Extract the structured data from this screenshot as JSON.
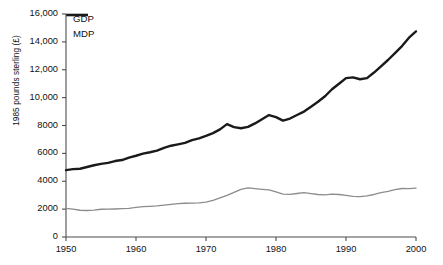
{
  "chart_data": {
    "type": "line",
    "title": "",
    "xlabel": "",
    "ylabel": "1985 pounds sterling (£)",
    "xlim": [
      1950,
      2000
    ],
    "ylim": [
      0,
      16000
    ],
    "grid": false,
    "legend_position": "top-left",
    "xticks": [
      "1950",
      "1960",
      "1970",
      "1980",
      "1990",
      "2000"
    ],
    "xtick_values": [
      1950,
      1960,
      1970,
      1980,
      1990,
      2000
    ],
    "yticks": [
      "0",
      "2000",
      "4000",
      "6000",
      "8000",
      "10,000",
      "12,000",
      "14,000",
      "16,000"
    ],
    "ytick_values": [
      0,
      2000,
      4000,
      6000,
      8000,
      10000,
      12000,
      14000,
      16000
    ],
    "x": [
      1950,
      1951,
      1952,
      1953,
      1954,
      1955,
      1956,
      1957,
      1958,
      1959,
      1960,
      1961,
      1962,
      1963,
      1964,
      1965,
      1966,
      1967,
      1968,
      1969,
      1970,
      1971,
      1972,
      1973,
      1974,
      1975,
      1976,
      1977,
      1978,
      1979,
      1980,
      1981,
      1982,
      1983,
      1984,
      1985,
      1986,
      1987,
      1988,
      1989,
      1990,
      1991,
      1992,
      1993,
      1994,
      1995,
      1996,
      1997,
      1998,
      1999,
      2000
    ],
    "series": [
      {
        "name": "GDP",
        "color": "#8c8c8c",
        "line_width": 1.3,
        "values": [
          2050,
          2000,
          1920,
          1900,
          1930,
          1990,
          2000,
          2010,
          2030,
          2060,
          2120,
          2180,
          2200,
          2230,
          2280,
          2340,
          2400,
          2420,
          2430,
          2450,
          2500,
          2620,
          2800,
          2980,
          3200,
          3420,
          3520,
          3470,
          3420,
          3380,
          3230,
          3080,
          3060,
          3120,
          3180,
          3110,
          3050,
          3020,
          3080,
          3050,
          2980,
          2910,
          2900,
          2950,
          3050,
          3180,
          3280,
          3400,
          3480,
          3470,
          3500
        ]
      },
      {
        "name": "MDP",
        "color": "#1a1a1a",
        "line_width": 2.4,
        "values": [
          4800,
          4870,
          4900,
          5020,
          5150,
          5250,
          5320,
          5450,
          5520,
          5700,
          5830,
          5980,
          6080,
          6200,
          6400,
          6550,
          6650,
          6750,
          6950,
          7080,
          7250,
          7450,
          7720,
          8100,
          7880,
          7800,
          7900,
          8150,
          8450,
          8750,
          8600,
          8350,
          8500,
          8750,
          9000,
          9350,
          9700,
          10100,
          10600,
          11000,
          11400,
          11450,
          11320,
          11400,
          11800,
          12250,
          12700,
          13200,
          13700,
          14300,
          14750
        ]
      }
    ]
  }
}
